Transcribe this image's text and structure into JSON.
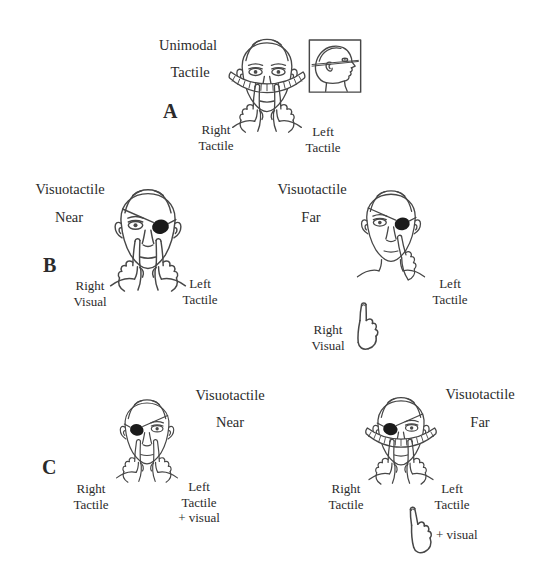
{
  "figure": {
    "panel_a": {
      "letter": "A",
      "condition_line1": "Unimodal",
      "condition_line2": "Tactile",
      "left_stim_line1": "Right",
      "left_stim_line2": "Tactile",
      "right_stim_line1": "Left",
      "right_stim_line2": "Tactile"
    },
    "panel_b": {
      "letter": "B",
      "near": {
        "title": "Visuotactile",
        "distance": "Near",
        "left_stim_line1": "Right",
        "left_stim_line2": "Visual",
        "right_stim_line1": "Left",
        "right_stim_line2": "Tactile"
      },
      "far": {
        "title": "Visuotactile",
        "distance": "Far",
        "right_stim_line1": "Left",
        "right_stim_line2": "Tactile",
        "far_stim_line1": "Right",
        "far_stim_line2": "Visual"
      }
    },
    "panel_c": {
      "letter": "C",
      "near": {
        "title": "Visuotactile",
        "distance": "Near",
        "left_stim_line1": "Right",
        "left_stim_line2": "Tactile",
        "right_stim_line1": "Left",
        "right_stim_line2": "Tactile",
        "right_stim_line3": "+ visual"
      },
      "far": {
        "title": "Visuotactile",
        "distance": "Far",
        "left_stim_line1": "Right",
        "left_stim_line2": "Tactile",
        "right_stim_line1": "Left",
        "right_stim_line2": "Tactile",
        "far_stim_label": "+ visual"
      }
    },
    "colors": {
      "ink": "#474747",
      "eye_patch": "#1b1b1b",
      "background": "#ffffff"
    }
  }
}
